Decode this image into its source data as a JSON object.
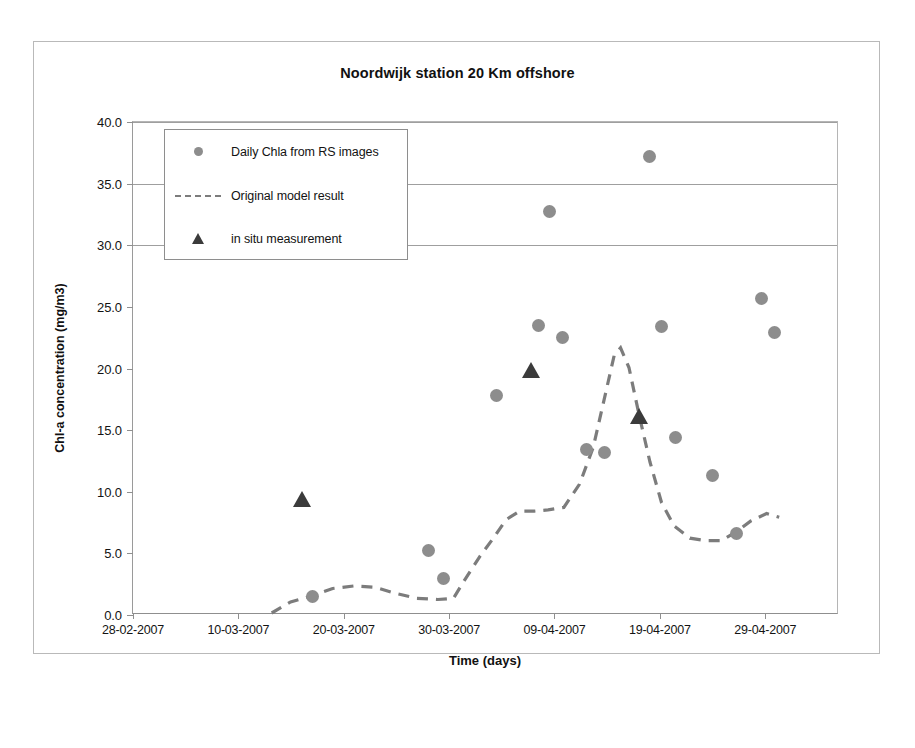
{
  "chart_data": {
    "type": "scatter",
    "title": "Noordwijk station 20 Km offshore",
    "xlabel": "Time (days)",
    "ylabel": "Chl-a concentration (mg/m3)",
    "ylim": [
      0.0,
      40.0
    ],
    "ytick_labels": [
      "0.0",
      "5.0",
      "10.0",
      "15.0",
      "20.0",
      "25.0",
      "30.0",
      "35.0",
      "40.0"
    ],
    "ytick_values": [
      0,
      5,
      10,
      15,
      20,
      25,
      30,
      35,
      40
    ],
    "xtick_labels": [
      "28-02-2007",
      "10-03-2007",
      "20-03-2007",
      "30-03-2007",
      "09-04-2007",
      "19-04-2007",
      "29-04-2007"
    ],
    "xtick_days": [
      0,
      10,
      20,
      30,
      40,
      50,
      60
    ],
    "xlim_days": [
      0,
      67
    ],
    "grid": "horizontal gridlines at 30.0, 35.0 and 40.0 only",
    "gridline_values": [
      30,
      35,
      40
    ],
    "legend_position": "upper left, inside plot",
    "series": [
      {
        "name": "Daily Chla from RS images",
        "marker": "circle",
        "color": "#8d8d8d",
        "points": [
          {
            "day": 17.0,
            "value": 1.5
          },
          {
            "day": 28.0,
            "value": 5.2
          },
          {
            "day": 29.5,
            "value": 3.0
          },
          {
            "day": 34.5,
            "value": 17.8
          },
          {
            "day": 38.5,
            "value": 23.5
          },
          {
            "day": 39.5,
            "value": 32.7
          },
          {
            "day": 40.8,
            "value": 22.5
          },
          {
            "day": 43.0,
            "value": 13.4
          },
          {
            "day": 44.7,
            "value": 13.2
          },
          {
            "day": 49.0,
            "value": 37.2
          },
          {
            "day": 50.2,
            "value": 23.4
          },
          {
            "day": 51.5,
            "value": 14.4
          },
          {
            "day": 55.0,
            "value": 11.3
          },
          {
            "day": 57.3,
            "value": 6.6
          },
          {
            "day": 59.6,
            "value": 25.7
          },
          {
            "day": 60.9,
            "value": 22.9
          }
        ]
      },
      {
        "name": "in situ measurement",
        "marker": "triangle",
        "color": "#3b3b3b",
        "points": [
          {
            "day": 16.0,
            "value": 9.3
          },
          {
            "day": 37.8,
            "value": 19.8
          },
          {
            "day": 48.0,
            "value": 16.1
          }
        ]
      },
      {
        "name": "Original model result",
        "marker": "dashed-line",
        "color": "#7c7c7c",
        "points": [
          {
            "day": 13.2,
            "value": 0.0
          },
          {
            "day": 15.0,
            "value": 0.9
          },
          {
            "day": 17.0,
            "value": 1.4
          },
          {
            "day": 19.0,
            "value": 2.0
          },
          {
            "day": 21.0,
            "value": 2.2
          },
          {
            "day": 23.0,
            "value": 2.1
          },
          {
            "day": 25.0,
            "value": 1.6
          },
          {
            "day": 27.0,
            "value": 1.2
          },
          {
            "day": 29.0,
            "value": 1.1
          },
          {
            "day": 30.5,
            "value": 1.2
          },
          {
            "day": 31.5,
            "value": 2.6
          },
          {
            "day": 33.0,
            "value": 4.6
          },
          {
            "day": 34.3,
            "value": 6.1
          },
          {
            "day": 35.5,
            "value": 7.6
          },
          {
            "day": 36.8,
            "value": 8.3
          },
          {
            "day": 38.2,
            "value": 8.3
          },
          {
            "day": 39.5,
            "value": 8.4
          },
          {
            "day": 41.0,
            "value": 8.6
          },
          {
            "day": 42.5,
            "value": 10.5
          },
          {
            "day": 43.8,
            "value": 13.5
          },
          {
            "day": 45.0,
            "value": 18.0
          },
          {
            "day": 45.8,
            "value": 21.0
          },
          {
            "day": 46.4,
            "value": 21.6
          },
          {
            "day": 47.2,
            "value": 20.0
          },
          {
            "day": 48.2,
            "value": 16.0
          },
          {
            "day": 49.2,
            "value": 12.3
          },
          {
            "day": 50.3,
            "value": 9.0
          },
          {
            "day": 51.5,
            "value": 7.1
          },
          {
            "day": 53.0,
            "value": 6.1
          },
          {
            "day": 54.5,
            "value": 5.9
          },
          {
            "day": 56.0,
            "value": 5.9
          },
          {
            "day": 57.4,
            "value": 6.6
          },
          {
            "day": 58.8,
            "value": 7.5
          },
          {
            "day": 60.3,
            "value": 8.1
          },
          {
            "day": 61.5,
            "value": 7.8
          }
        ]
      }
    ]
  },
  "legend": {
    "items": [
      {
        "label": "Daily Chla from RS images",
        "key": "circle-marker"
      },
      {
        "label": "Original model result",
        "key": "dashed-line"
      },
      {
        "label": "in situ measurement",
        "key": "triangle-marker"
      }
    ]
  },
  "colors": {
    "circle_marker": "#8d8d8d",
    "triangle_marker": "#3b3b3b",
    "model_line": "#7c7c7c",
    "axis": "#8f8f8f",
    "gridline": "#9f9f9f",
    "text": "#131313"
  }
}
